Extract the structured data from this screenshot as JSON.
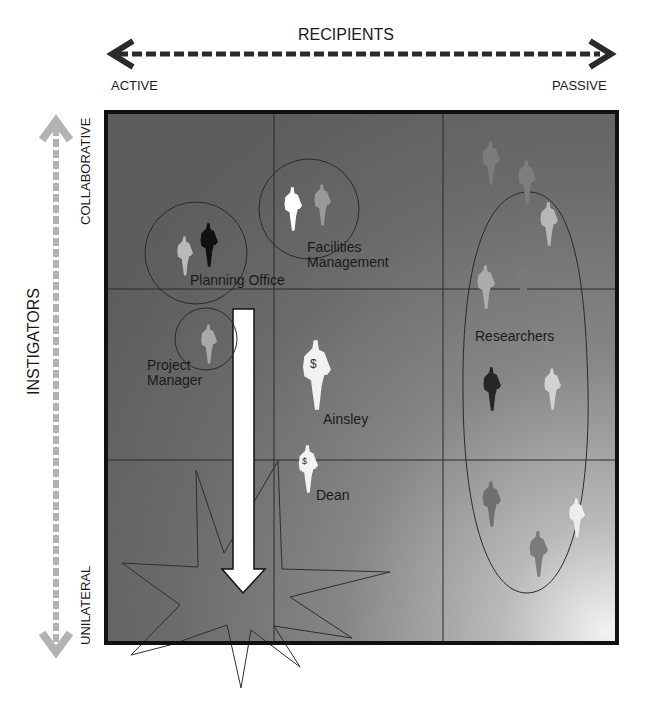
{
  "x_axis": {
    "title": "RECIPIENTS",
    "left_end": "ACTIVE",
    "right_end": "PASSIVE"
  },
  "y_axis": {
    "title": "INSTIGATORS",
    "top_end": "COLLABORATIVE",
    "bottom_end": "UNILATERAL"
  },
  "grid": {
    "rows": 3,
    "columns": 3
  },
  "groups": [
    {
      "label": "Planning Office",
      "figures": [
        "light-gray",
        "black"
      ]
    },
    {
      "label_line1": "Facilities",
      "label_line2": "Management",
      "figures": [
        "white",
        "gray"
      ]
    },
    {
      "label_line1": "Project",
      "label_line2": "Manager",
      "figures": [
        "gray"
      ]
    },
    {
      "label": "Researchers",
      "figures": 12
    }
  ],
  "individuals": [
    {
      "label": "Ainsley",
      "symbol": "$"
    },
    {
      "label": "Dean",
      "symbol": "$"
    }
  ],
  "colors": {
    "panel_dark": "#5f5f5f",
    "panel_light": "#e8e8e8",
    "x_arrow": "#2b2b2b",
    "y_arrow": "#b5b5b5",
    "outline": "#1a1a1a"
  }
}
